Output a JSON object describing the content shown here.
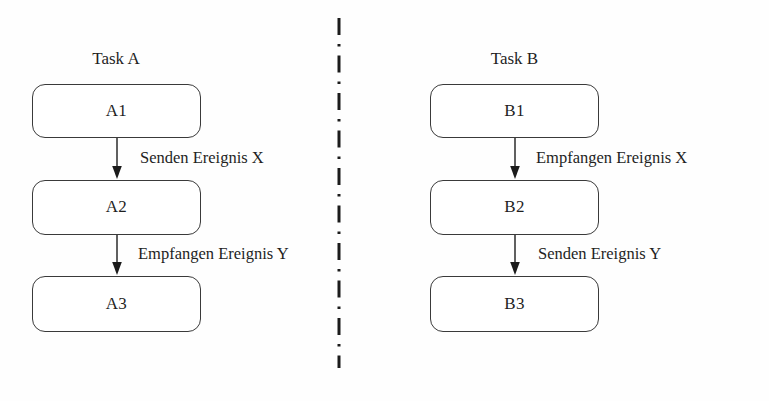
{
  "diagram": {
    "background_color": "#fefefe",
    "stroke_color": "#3a3a3a",
    "text_color": "#1f1f1f",
    "divider": {
      "style": "dash-dot",
      "orientation": "vertical",
      "color": "#1b1b1b"
    },
    "columns": [
      {
        "id": "task-a",
        "title": "Task A",
        "nodes": [
          {
            "id": "a1",
            "label": "A1"
          },
          {
            "id": "a2",
            "label": "A2"
          },
          {
            "id": "a3",
            "label": "A3"
          }
        ],
        "edges": [
          {
            "id": "a1-a2",
            "label": "Senden Ereignis X",
            "from": "A1",
            "to": "A2"
          },
          {
            "id": "a2-a3",
            "label": "Empfangen Ereignis Y",
            "from": "A2",
            "to": "A3"
          }
        ]
      },
      {
        "id": "task-b",
        "title": "Task B",
        "nodes": [
          {
            "id": "b1",
            "label": "B1"
          },
          {
            "id": "b2",
            "label": "B2"
          },
          {
            "id": "b3",
            "label": "B3"
          }
        ],
        "edges": [
          {
            "id": "b1-b2",
            "label": "Empfangen Ereignis X",
            "from": "B1",
            "to": "B2"
          },
          {
            "id": "b2-b3",
            "label": "Senden Ereignis Y",
            "from": "B2",
            "to": "B3"
          }
        ]
      }
    ]
  }
}
